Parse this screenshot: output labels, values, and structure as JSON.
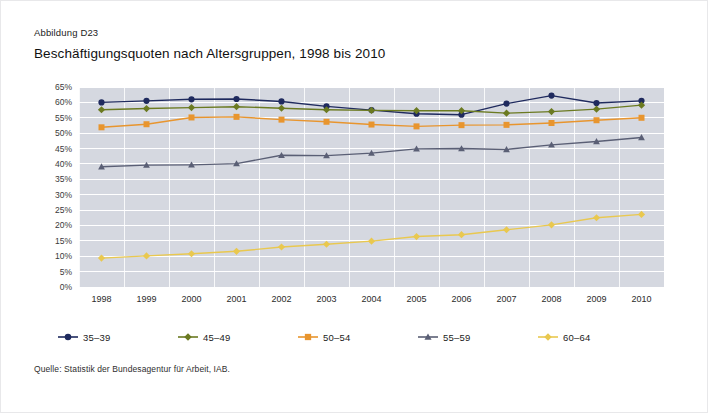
{
  "figure": {
    "label": "Abbildung D23",
    "title": "Beschäftigungsquoten nach Altersgruppen, 1998 bis 2010",
    "source": "Quelle: Statistik der Bundesagentur für Arbeit, IAB."
  },
  "chart_data": {
    "type": "line",
    "title": "Beschäftigungsquoten nach Altersgruppen, 1998 bis 2010",
    "xlabel": "",
    "ylabel": "",
    "x": [
      "1998",
      "1999",
      "2000",
      "2001",
      "2002",
      "2003",
      "2004",
      "2005",
      "2006",
      "2007",
      "2008",
      "2009",
      "2010"
    ],
    "categories": [
      "1998",
      "1999",
      "2000",
      "2001",
      "2002",
      "2003",
      "2004",
      "2005",
      "2006",
      "2007",
      "2008",
      "2009",
      "2010"
    ],
    "ylim": [
      0,
      65
    ],
    "ytick_step": 5,
    "ytick_labels": [
      "0%",
      "5%",
      "10%",
      "15%",
      "20%",
      "25%",
      "30%",
      "35%",
      "40%",
      "45%",
      "50%",
      "55%",
      "60%",
      "65%"
    ],
    "ytick_values": [
      0,
      5,
      10,
      15,
      20,
      25,
      30,
      35,
      40,
      45,
      50,
      55,
      60,
      65
    ],
    "grid": true,
    "legend_position": "below",
    "series": [
      {
        "name": "35–39",
        "color": "#1f2a5e",
        "marker": "circle",
        "values": [
          60.0,
          60.5,
          61.0,
          61.1,
          60.3,
          58.7,
          57.5,
          56.3,
          56.0,
          59.6,
          62.2,
          59.8,
          60.5
        ]
      },
      {
        "name": "45–49",
        "color": "#6b7a21",
        "marker": "diamond",
        "values": [
          57.6,
          58.0,
          58.3,
          58.6,
          58.1,
          57.6,
          57.4,
          57.3,
          57.3,
          56.5,
          57.0,
          57.8,
          59.1
        ]
      },
      {
        "name": "50–54",
        "color": "#e8952e",
        "marker": "square",
        "values": [
          51.9,
          52.9,
          55.1,
          55.3,
          54.4,
          53.7,
          52.8,
          52.2,
          52.6,
          52.7,
          53.3,
          54.2,
          55.0
        ]
      },
      {
        "name": "55–59",
        "color": "#5a5f75",
        "marker": "triangle",
        "values": [
          39.1,
          39.6,
          39.7,
          40.1,
          42.8,
          42.7,
          43.5,
          44.9,
          45.0,
          44.7,
          46.2,
          47.3,
          48.6
        ]
      },
      {
        "name": "60–64",
        "color": "#e9c84f",
        "marker": "diamond",
        "values": [
          9.4,
          10.1,
          10.8,
          11.6,
          13.0,
          13.9,
          14.9,
          16.4,
          17.0,
          18.6,
          20.2,
          22.5,
          23.6
        ]
      }
    ]
  },
  "style": {
    "plot_background": "#d5d8e0",
    "grid_color": "#ffffff",
    "page_background": "#ffffff"
  }
}
